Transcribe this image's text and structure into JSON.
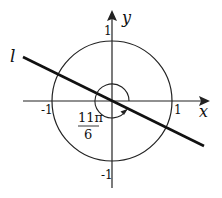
{
  "diagram": {
    "type": "unit-circle-angle",
    "axes": {
      "x_label": "x",
      "y_label": "y",
      "x_ticks": [
        "-1",
        "1"
      ],
      "y_ticks": [
        "-1",
        "1"
      ]
    },
    "line_label": "l",
    "angle": {
      "numerator": "11π",
      "denominator": "6",
      "value": "11π/6"
    },
    "colors": {
      "stroke": "#111111",
      "background": "#ffffff"
    }
  }
}
